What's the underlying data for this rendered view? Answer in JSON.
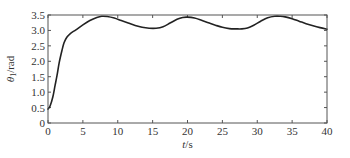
{
  "chart_data": {
    "type": "line",
    "title": "",
    "xlabel": "t/s",
    "xlabel_parts": {
      "var": "t",
      "unit": "/s"
    },
    "ylabel": "θ1/rad",
    "ylabel_parts": {
      "var": "θ",
      "sub": "1",
      "unit": "/rad"
    },
    "xlim": [
      0,
      40
    ],
    "ylim": [
      0,
      3.5
    ],
    "xticks": [
      0,
      5,
      10,
      15,
      20,
      25,
      30,
      35,
      40
    ],
    "xtick_labels": [
      "0",
      "5",
      "10",
      "15",
      "20",
      "25",
      "30",
      "35",
      "40"
    ],
    "yticks": [
      0,
      0.5,
      1.0,
      1.5,
      2.0,
      2.5,
      3.0,
      3.5
    ],
    "ytick_labels": [
      "0",
      "0.5",
      "1.0",
      "1.5",
      "2.0",
      "2.5",
      "3.0",
      "3.5"
    ],
    "grid": false,
    "legend": null,
    "series": [
      {
        "name": "θ1",
        "color": "#222222",
        "x": [
          0,
          0.3,
          0.7,
          1.0,
          1.3,
          1.6,
          2.0,
          2.3,
          2.7,
          3.2,
          4.0,
          5.0,
          6.0,
          7.0,
          7.7,
          8.5,
          9.5,
          10.5,
          11.5,
          12.5,
          13.5,
          14.5,
          15.5,
          16.5,
          17.5,
          18.5,
          19.3,
          20.0,
          21.0,
          22.0,
          23.0,
          24.0,
          25.0,
          26.0,
          27.0,
          27.8,
          28.6,
          29.5,
          30.5,
          31.5,
          32.5,
          33.3,
          34.0,
          35.0,
          36.0,
          37.0,
          38.0,
          39.0,
          40.0
        ],
        "values": [
          0.45,
          0.55,
          0.85,
          1.2,
          1.55,
          1.95,
          2.35,
          2.6,
          2.78,
          2.9,
          3.02,
          3.18,
          3.32,
          3.42,
          3.46,
          3.45,
          3.4,
          3.32,
          3.24,
          3.16,
          3.1,
          3.07,
          3.07,
          3.12,
          3.24,
          3.36,
          3.42,
          3.43,
          3.4,
          3.33,
          3.25,
          3.17,
          3.1,
          3.06,
          3.05,
          3.05,
          3.08,
          3.17,
          3.3,
          3.41,
          3.46,
          3.46,
          3.44,
          3.38,
          3.3,
          3.22,
          3.15,
          3.09,
          3.04
        ]
      }
    ]
  }
}
